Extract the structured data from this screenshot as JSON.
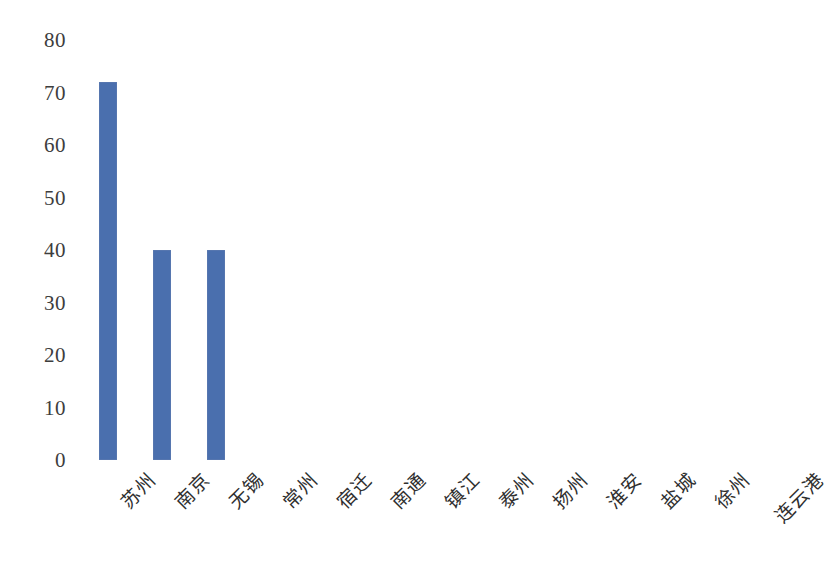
{
  "chart_data": {
    "type": "bar",
    "title": "",
    "subtitle": "",
    "xlabel": "",
    "ylabel": "",
    "categories": [
      "苏州",
      "南京",
      "无锡",
      "常州",
      "宿迁",
      "南通",
      "镇江",
      "泰州",
      "扬州",
      "淮安",
      "盐城",
      "徐州",
      "连云港"
    ],
    "values": [
      72,
      40,
      40,
      0,
      0,
      0,
      0,
      0,
      0,
      0,
      0,
      0,
      0
    ],
    "series": [
      {
        "name": "",
        "values": [
          72,
          40,
          40,
          0,
          0,
          0,
          0,
          0,
          0,
          0,
          0,
          0,
          0
        ],
        "color": "#4a6fae"
      }
    ],
    "ylim": [
      0,
      80
    ],
    "ytick_values": [
      0,
      10,
      20,
      30,
      40,
      50,
      60,
      70,
      80
    ],
    "ytick_labels": [
      "0",
      "10",
      "20",
      "30",
      "40",
      "50",
      "60",
      "70",
      "80"
    ],
    "grid": false,
    "legend": false,
    "legend_position": "none",
    "axis_lines": false,
    "bar_color": "#4a6fae",
    "background_color": "#ffffff",
    "text_color": "#3a3a3a",
    "xtick_rotation": 45
  }
}
